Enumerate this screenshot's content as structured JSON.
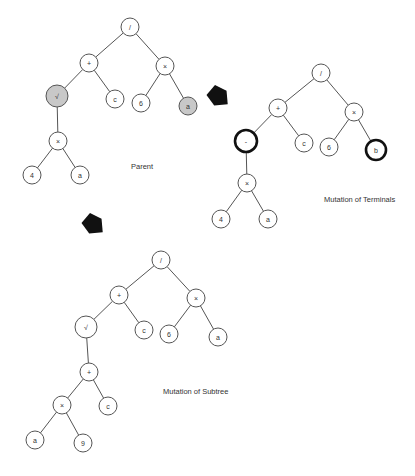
{
  "captions": {
    "parent": "Parent",
    "terminals": "Mutation of Terminals",
    "subtree": "Mutation of Subtree"
  },
  "colors": {
    "edge": "#555555",
    "node_fill": "#ffffff",
    "highlight_gray": "#c8c8c8",
    "highlight_bold": "#111111",
    "arrow": "#111111"
  },
  "trees": [
    {
      "id": "parent",
      "caption": "Parent",
      "caption_pos": [
        131,
        166
      ],
      "nodes": [
        {
          "id": "p0",
          "label": "/",
          "x": 130,
          "y": 27,
          "r": 9,
          "style": "normal"
        },
        {
          "id": "p1",
          "label": "+",
          "x": 89,
          "y": 63,
          "r": 9,
          "style": "normal"
        },
        {
          "id": "p2",
          "label": "×",
          "x": 165,
          "y": 66,
          "r": 9,
          "style": "normal"
        },
        {
          "id": "p3",
          "label": "√",
          "x": 57,
          "y": 96,
          "r": 11,
          "style": "gray"
        },
        {
          "id": "p4",
          "label": "c",
          "x": 115,
          "y": 99,
          "r": 9,
          "style": "normal"
        },
        {
          "id": "p5",
          "label": "6",
          "x": 141,
          "y": 103,
          "r": 9,
          "style": "normal"
        },
        {
          "id": "p6",
          "label": "a",
          "x": 188,
          "y": 106,
          "r": 9,
          "style": "gray"
        },
        {
          "id": "p7",
          "label": "×",
          "x": 58,
          "y": 141,
          "r": 9,
          "style": "normal"
        },
        {
          "id": "p8",
          "label": "4",
          "x": 32,
          "y": 175,
          "r": 9,
          "style": "normal"
        },
        {
          "id": "p9",
          "label": "a",
          "x": 80,
          "y": 175,
          "r": 9,
          "style": "normal"
        }
      ],
      "edges": [
        [
          "p0",
          "p1"
        ],
        [
          "p0",
          "p2"
        ],
        [
          "p1",
          "p3"
        ],
        [
          "p1",
          "p4"
        ],
        [
          "p2",
          "p5"
        ],
        [
          "p2",
          "p6"
        ],
        [
          "p3",
          "p7"
        ],
        [
          "p7",
          "p8"
        ],
        [
          "p7",
          "p9"
        ]
      ]
    },
    {
      "id": "terminals",
      "caption": "Mutation of Terminals",
      "caption_pos": [
        324,
        199
      ],
      "nodes": [
        {
          "id": "t0",
          "label": "/",
          "x": 321,
          "y": 73,
          "r": 9,
          "style": "normal"
        },
        {
          "id": "t1",
          "label": "+",
          "x": 278,
          "y": 108,
          "r": 9,
          "style": "normal"
        },
        {
          "id": "t2",
          "label": "×",
          "x": 354,
          "y": 112,
          "r": 9,
          "style": "normal"
        },
        {
          "id": "t3",
          "label": "-",
          "x": 246,
          "y": 141,
          "r": 11,
          "style": "bold"
        },
        {
          "id": "t4",
          "label": "c",
          "x": 304,
          "y": 143,
          "r": 9,
          "style": "normal"
        },
        {
          "id": "t5",
          "label": "6",
          "x": 329,
          "y": 147,
          "r": 9,
          "style": "normal"
        },
        {
          "id": "t6",
          "label": "b",
          "x": 376,
          "y": 150,
          "r": 10,
          "style": "bold"
        },
        {
          "id": "t7",
          "label": "×",
          "x": 247,
          "y": 183,
          "r": 9,
          "style": "normal"
        },
        {
          "id": "t8",
          "label": "4",
          "x": 221,
          "y": 219,
          "r": 9,
          "style": "normal"
        },
        {
          "id": "t9",
          "label": "a",
          "x": 268,
          "y": 219,
          "r": 9,
          "style": "normal"
        }
      ],
      "edges": [
        [
          "t0",
          "t1"
        ],
        [
          "t0",
          "t2"
        ],
        [
          "t1",
          "t3"
        ],
        [
          "t1",
          "t4"
        ],
        [
          "t2",
          "t5"
        ],
        [
          "t2",
          "t6"
        ],
        [
          "t3",
          "t7"
        ],
        [
          "t7",
          "t8"
        ],
        [
          "t7",
          "t9"
        ]
      ]
    },
    {
      "id": "subtree",
      "caption": "Mutation of Subtree",
      "caption_pos": [
        163,
        391
      ],
      "nodes": [
        {
          "id": "s0",
          "label": "/",
          "x": 161,
          "y": 260,
          "r": 9,
          "style": "normal"
        },
        {
          "id": "s1",
          "label": "+",
          "x": 119,
          "y": 295,
          "r": 9,
          "style": "normal"
        },
        {
          "id": "s2",
          "label": "×",
          "x": 196,
          "y": 298,
          "r": 9,
          "style": "normal"
        },
        {
          "id": "s3",
          "label": "√",
          "x": 86,
          "y": 327,
          "r": 11,
          "style": "normal"
        },
        {
          "id": "s4",
          "label": "c",
          "x": 144,
          "y": 330,
          "r": 9,
          "style": "normal"
        },
        {
          "id": "s5",
          "label": "6",
          "x": 169,
          "y": 334,
          "r": 9,
          "style": "normal"
        },
        {
          "id": "s6",
          "label": "a",
          "x": 218,
          "y": 337,
          "r": 9,
          "style": "normal"
        },
        {
          "id": "s7",
          "label": "+",
          "x": 89,
          "y": 372,
          "r": 9,
          "style": "normal"
        },
        {
          "id": "s8",
          "label": "×",
          "x": 62,
          "y": 405,
          "r": 9,
          "style": "normal"
        },
        {
          "id": "s9",
          "label": "c",
          "x": 108,
          "y": 406,
          "r": 9,
          "style": "normal"
        },
        {
          "id": "s10",
          "label": "a",
          "x": 35,
          "y": 440,
          "r": 9,
          "style": "normal"
        },
        {
          "id": "s11",
          "label": "9",
          "x": 83,
          "y": 443,
          "r": 9,
          "style": "normal"
        }
      ],
      "edges": [
        [
          "s0",
          "s1"
        ],
        [
          "s0",
          "s2"
        ],
        [
          "s1",
          "s3"
        ],
        [
          "s1",
          "s4"
        ],
        [
          "s2",
          "s5"
        ],
        [
          "s2",
          "s6"
        ],
        [
          "s3",
          "s7"
        ],
        [
          "s7",
          "s8"
        ],
        [
          "s7",
          "s9"
        ],
        [
          "s8",
          "s10"
        ],
        [
          "s8",
          "s11"
        ]
      ]
    }
  ],
  "arrows": [
    {
      "id": "arrow-to-terminals",
      "cx": 219,
      "cy": 97,
      "size": 12,
      "direction": "down-right"
    },
    {
      "id": "arrow-to-subtree",
      "cx": 94,
      "cy": 225,
      "size": 12,
      "direction": "down-right"
    }
  ]
}
